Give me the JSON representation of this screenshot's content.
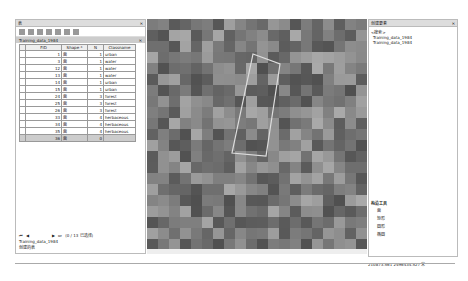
{
  "left_panel": {
    "title": "表",
    "tab": "Training_data_1984",
    "columns": [
      "FID",
      "Shape *",
      "N",
      "Classname"
    ],
    "rows": [
      {
        "fid": "1",
        "shape": "面",
        "n": "1",
        "classname": "urban"
      },
      {
        "fid": "3",
        "shape": "面",
        "n": "1",
        "classname": "water"
      },
      {
        "fid": "12",
        "shape": "面",
        "n": "1",
        "classname": "water"
      },
      {
        "fid": "13",
        "shape": "面",
        "n": "1",
        "classname": "water"
      },
      {
        "fid": "14",
        "shape": "面",
        "n": "1",
        "classname": "urban"
      },
      {
        "fid": "15",
        "shape": "面",
        "n": "1",
        "classname": "urban"
      },
      {
        "fid": "24",
        "shape": "面",
        "n": "3",
        "classname": "forest"
      },
      {
        "fid": "25",
        "shape": "面",
        "n": "3",
        "classname": "forest"
      },
      {
        "fid": "26",
        "shape": "面",
        "n": "3",
        "classname": "forest"
      },
      {
        "fid": "33",
        "shape": "面",
        "n": "4",
        "classname": "herbaceous"
      },
      {
        "fid": "34",
        "shape": "面",
        "n": "4",
        "classname": "herbaceous"
      },
      {
        "fid": "35",
        "shape": "面",
        "n": "4",
        "classname": "herbaceous"
      },
      {
        "fid": "36",
        "shape": "面",
        "n": "0",
        "classname": ""
      }
    ],
    "record_status": "(0 / 13 已选择)",
    "footer_tab": "Training_data_1984",
    "footer_btn": "创建的表"
  },
  "right_panel": {
    "title": "创建要素",
    "search": "<搜索>",
    "group": "Training_data_1984",
    "layer": "Training_data_1984",
    "tools_title": "构造工具",
    "tools": [
      "面",
      "矩形",
      "圆形",
      "椭圆"
    ]
  },
  "status_coords": "210873.561  2496434.527 米"
}
